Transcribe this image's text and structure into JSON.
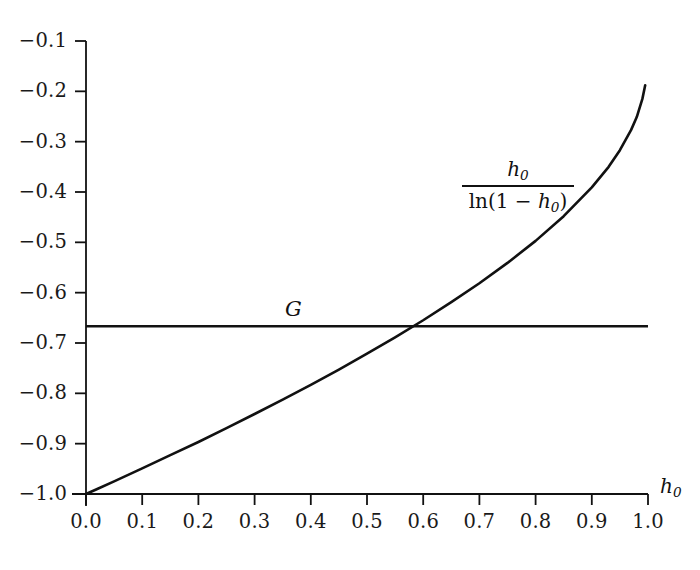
{
  "chart_data": {
    "type": "line",
    "title": "",
    "xlabel": "h_0",
    "ylabel": "",
    "xlim": [
      0.0,
      1.0
    ],
    "ylim": [
      -1.0,
      -0.1
    ],
    "grid": false,
    "legend_position": "inline-annotations",
    "x_ticks": [
      "0.0",
      "0.1",
      "0.2",
      "0.3",
      "0.4",
      "0.5",
      "0.6",
      "0.7",
      "0.8",
      "0.9",
      "1.0"
    ],
    "x_tick_values": [
      0.0,
      0.1,
      0.2,
      0.3,
      0.4,
      0.5,
      0.6,
      0.7,
      0.8,
      0.9,
      1.0
    ],
    "y_ticks": [
      "−0.1",
      "−0.2",
      "−0.3",
      "−0.4",
      "−0.5",
      "−0.6",
      "−0.7",
      "−0.8",
      "−0.9",
      "−1.0"
    ],
    "y_tick_values": [
      -0.1,
      -0.2,
      -0.3,
      -0.4,
      -0.5,
      -0.6,
      -0.7,
      -0.8,
      -0.9,
      -1.0
    ],
    "series": [
      {
        "name": "h_0 / ln(1 - h_0)",
        "label_numerator": "h",
        "label_numerator_sub": "0",
        "label_denominator_prefix": "ln(1 − ",
        "label_denominator_var": "h",
        "label_denominator_sub": "0",
        "label_denominator_suffix": ")",
        "type": "curve",
        "color": "#111111",
        "x": [
          0.0,
          0.02,
          0.05,
          0.1,
          0.15,
          0.2,
          0.25,
          0.3,
          0.35,
          0.4,
          0.45,
          0.5,
          0.55,
          0.6,
          0.65,
          0.7,
          0.75,
          0.8,
          0.85,
          0.9,
          0.93,
          0.95,
          0.97,
          0.98,
          0.99,
          0.995
        ],
        "values": [
          -1.0,
          -0.99,
          -0.9748,
          -0.9491,
          -0.9228,
          -0.8966,
          -0.869,
          -0.841,
          -0.8124,
          -0.783,
          -0.7527,
          -0.7213,
          -0.6886,
          -0.6548,
          -0.6189,
          -0.5813,
          -0.5409,
          -0.4971,
          -0.448,
          -0.3908,
          -0.35,
          -0.317,
          -0.2766,
          -0.2511,
          -0.215,
          -0.188
        ]
      },
      {
        "name": "G",
        "label": "G",
        "type": "horizontal-line",
        "color": "#111111",
        "value": -0.6667
      }
    ],
    "intersection": {
      "x": 0.583,
      "y": -0.6667
    }
  },
  "axes": {
    "x_axis_name": "h0-axis",
    "y_axis_name": "value-axis",
    "x_axis_label": "h",
    "x_axis_label_sub": "0"
  }
}
